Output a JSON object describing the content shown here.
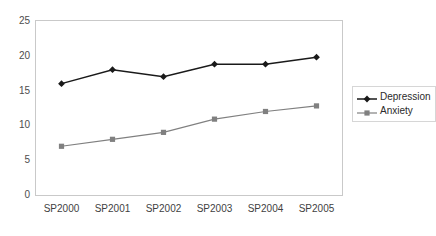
{
  "chart_data": {
    "type": "line",
    "title": "",
    "xlabel": "",
    "ylabel": "",
    "categories": [
      "SP2000",
      "SP2001",
      "SP2002",
      "SP2003",
      "SP2004",
      "SP2005"
    ],
    "ylim": [
      0,
      25
    ],
    "yticks": [
      0,
      5,
      10,
      15,
      20,
      25
    ],
    "grid": false,
    "legend_position": "right",
    "series": [
      {
        "name": "Depression",
        "color": "#1a1a1a",
        "marker": "diamond",
        "values": [
          16.0,
          18.0,
          17.0,
          18.8,
          18.8,
          19.8
        ]
      },
      {
        "name": "Anxiety",
        "color": "#808080",
        "marker": "square",
        "values": [
          7.0,
          8.0,
          9.0,
          10.9,
          12.0,
          12.8
        ]
      }
    ]
  },
  "axis": {
    "y_tick_labels": [
      "25",
      "20",
      "15",
      "10",
      "5",
      "0"
    ],
    "x_tick_labels": [
      "SP2000",
      "SP2001",
      "SP2002",
      "SP2003",
      "SP2004",
      "SP2005"
    ]
  },
  "legend": {
    "entries": [
      {
        "label": "Depression"
      },
      {
        "label": "Anxiety"
      }
    ]
  }
}
